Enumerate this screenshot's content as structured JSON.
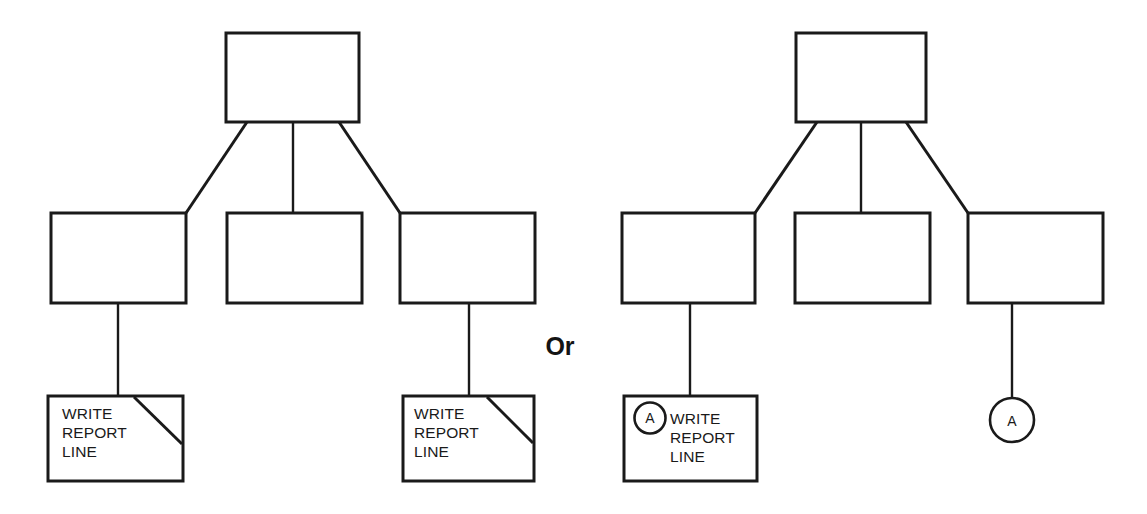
{
  "diagram": {
    "kind": "structure-chart",
    "background_color": "#ffffff",
    "stroke_color": "#1a1a1a",
    "separator_label": "Or",
    "module_label_lines": [
      "WRITE",
      "REPORT",
      "LINE"
    ],
    "connector_letter": "A",
    "variants": [
      {
        "id": "left-variant",
        "name": "duplicated-library-module-variant",
        "root": {
          "id": "left-root",
          "label": ""
        },
        "level2": [
          {
            "id": "left-child-1",
            "label": ""
          },
          {
            "id": "left-child-2",
            "label": ""
          },
          {
            "id": "left-child-3",
            "label": ""
          }
        ],
        "leaves": [
          {
            "id": "left-leaf-1",
            "lines": [
              "WRITE",
              "REPORT",
              "LINE"
            ],
            "corner_slash": true,
            "connector": null
          },
          {
            "id": "left-leaf-2",
            "lines": [
              "WRITE",
              "REPORT",
              "LINE"
            ],
            "corner_slash": true,
            "connector": null
          }
        ]
      },
      {
        "id": "right-variant",
        "name": "off-page-connector-variant",
        "root": {
          "id": "right-root",
          "label": ""
        },
        "level2": [
          {
            "id": "right-child-1",
            "label": ""
          },
          {
            "id": "right-child-2",
            "label": ""
          },
          {
            "id": "right-child-3",
            "label": ""
          }
        ],
        "leaves": [
          {
            "id": "right-leaf-1",
            "lines": [
              "WRITE",
              "REPORT",
              "LINE"
            ],
            "corner_slash": false,
            "connector": "A"
          },
          {
            "id": "right-connector-only",
            "lines": [],
            "corner_slash": false,
            "connector": "A"
          }
        ]
      }
    ]
  },
  "text": {
    "or": "Or",
    "write": "WRITE",
    "report": "REPORT",
    "line": "LINE",
    "letter_a": "A",
    "letter_a2": "A"
  }
}
